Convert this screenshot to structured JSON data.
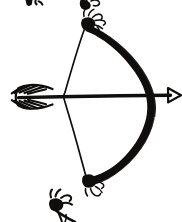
{
  "image": {
    "title": "Bow and arrow",
    "medium": "hand-drawn black ink sketch",
    "background_color": "#ffffff",
    "ink_color": "#100d0c",
    "width": 182,
    "height": 222
  },
  "drawing": {
    "subject_label": "bow-and-arrow",
    "orientation": "bow curve opens to the right, arrow points right",
    "parts": [
      {
        "name": "bow-limb",
        "label": "bow limb",
        "description": "thick black curved arc from top tip to bottom tip bulging right"
      },
      {
        "name": "bow-string",
        "label": "bowstring",
        "description": "thin line drawn back into a V at the nocking point"
      },
      {
        "name": "arrow-shaft",
        "label": "arrow shaft",
        "description": "horizontal line crossing the bow"
      },
      {
        "name": "arrow-head",
        "label": "arrowhead",
        "description": "small outlined triangle pointing right"
      },
      {
        "name": "arrow-fletching",
        "label": "fletching",
        "description": "feather chevrons at the left end of the shaft"
      },
      {
        "name": "bow-tip-top",
        "label": "upper nock",
        "description": "filled blob with squiggly string wraps"
      },
      {
        "name": "bow-tip-bottom",
        "label": "lower nock",
        "description": "filled blob with squiggly string wraps"
      }
    ]
  },
  "geometry": {
    "bow_tip_top": {
      "x": 88,
      "y": 22
    },
    "bow_tip_bottom": {
      "x": 89,
      "y": 181
    },
    "bow_apex_right": {
      "x": 155,
      "y": 99
    },
    "nock_point": {
      "x": 63,
      "y": 96
    },
    "shaft_left_end": {
      "x": 18,
      "y": 97
    },
    "shaft_right_end": {
      "x": 181,
      "y": 95
    },
    "arrowhead_tip": {
      "x": 181,
      "y": 95
    }
  },
  "fragments": [
    {
      "name": "fragment-top-left",
      "label": "partial ink mark, top left edge"
    },
    {
      "name": "fragment-bottom",
      "label": "partial bow tip from drawing below"
    }
  ]
}
